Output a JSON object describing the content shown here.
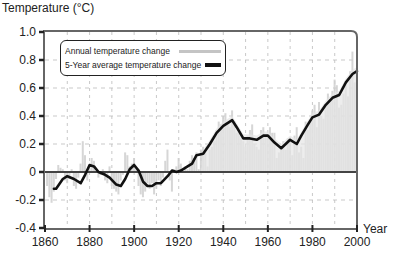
{
  "chart_data": {
    "type": "line",
    "title": "",
    "ylabel": "Temperature (°C)",
    "xlabel": "Year",
    "xlim": [
      1860,
      2000
    ],
    "ylim": [
      -0.4,
      1.0
    ],
    "x_ticks": [
      1860,
      1880,
      1900,
      1920,
      1940,
      1960,
      1980,
      2000
    ],
    "y_ticks": [
      -0.4,
      -0.2,
      0,
      0.2,
      0.4,
      0.6,
      0.8,
      1.0
    ],
    "x_tick_labels": [
      "1860",
      "1880",
      "1900",
      "1920",
      "1940",
      "1960",
      "1980",
      "2000"
    ],
    "y_tick_labels": [
      "-0.4",
      "-0.2",
      "0",
      "0.2",
      "0.4",
      "0.6",
      "0.8",
      "1.0"
    ],
    "grid": true,
    "legend_position": "upper left",
    "series": [
      {
        "name": "Annual temperature change",
        "style": "light gray bars",
        "color": "#c8c8c8",
        "x": [
          1861,
          1862,
          1863,
          1864,
          1865,
          1866,
          1867,
          1868,
          1869,
          1870,
          1871,
          1872,
          1873,
          1874,
          1875,
          1876,
          1877,
          1878,
          1879,
          1880,
          1881,
          1882,
          1883,
          1884,
          1885,
          1886,
          1887,
          1888,
          1889,
          1890,
          1891,
          1892,
          1893,
          1894,
          1895,
          1896,
          1897,
          1898,
          1899,
          1900,
          1901,
          1902,
          1903,
          1904,
          1905,
          1906,
          1907,
          1908,
          1909,
          1910,
          1911,
          1912,
          1913,
          1914,
          1915,
          1916,
          1917,
          1918,
          1919,
          1920,
          1921,
          1922,
          1923,
          1924,
          1925,
          1926,
          1927,
          1928,
          1929,
          1930,
          1931,
          1932,
          1933,
          1934,
          1935,
          1936,
          1937,
          1938,
          1939,
          1940,
          1941,
          1942,
          1943,
          1944,
          1945,
          1946,
          1947,
          1948,
          1949,
          1950,
          1951,
          1952,
          1953,
          1954,
          1955,
          1956,
          1957,
          1958,
          1959,
          1960,
          1961,
          1962,
          1963,
          1964,
          1965,
          1966,
          1967,
          1968,
          1969,
          1970,
          1971,
          1972,
          1973,
          1974,
          1975,
          1976,
          1977,
          1978,
          1979,
          1980,
          1981,
          1982,
          1983,
          1984,
          1985,
          1986,
          1987,
          1988,
          1989,
          1990,
          1991,
          1992,
          1993,
          1994,
          1995,
          1996,
          1997,
          1998,
          1999,
          2000
        ],
        "values": [
          -0.1,
          -0.18,
          -0.22,
          -0.14,
          -0.05,
          0.05,
          0.03,
          0.02,
          -0.06,
          -0.08,
          -0.05,
          0.02,
          -0.1,
          -0.12,
          -0.04,
          0.06,
          0.22,
          0.12,
          -0.06,
          0.05,
          0.1,
          0.08,
          0.0,
          -0.04,
          -0.02,
          0.02,
          -0.06,
          -0.08,
          0.04,
          -0.1,
          -0.12,
          -0.14,
          -0.16,
          -0.06,
          -0.02,
          0.14,
          0.12,
          0.04,
          0.06,
          0.1,
          0.02,
          -0.1,
          -0.16,
          -0.18,
          -0.14,
          -0.08,
          -0.12,
          -0.08,
          -0.16,
          -0.12,
          -0.06,
          -0.1,
          -0.04,
          0.08,
          0.16,
          -0.06,
          -0.14,
          0.02,
          0.04,
          0.1,
          0.06,
          0.0,
          0.04,
          0.02,
          0.08,
          0.12,
          0.1,
          0.14,
          0.02,
          0.16,
          0.18,
          0.14,
          0.04,
          0.16,
          0.18,
          0.22,
          0.3,
          0.36,
          0.34,
          0.4,
          0.42,
          0.34,
          0.32,
          0.44,
          0.36,
          0.28,
          0.3,
          0.24,
          0.22,
          0.18,
          0.26,
          0.3,
          0.34,
          0.2,
          0.18,
          0.16,
          0.3,
          0.32,
          0.26,
          0.24,
          0.32,
          0.28,
          0.28,
          0.1,
          0.14,
          0.18,
          0.22,
          0.16,
          0.24,
          0.22,
          0.12,
          0.26,
          0.32,
          0.14,
          0.18,
          0.1,
          0.36,
          0.3,
          0.36,
          0.44,
          0.48,
          0.32,
          0.5,
          0.4,
          0.38,
          0.48,
          0.56,
          0.52,
          0.58,
          0.66,
          0.62,
          0.46,
          0.48,
          0.56,
          0.62,
          0.54,
          0.72,
          0.86,
          0.64,
          0.66
        ]
      },
      {
        "name": "5-Year average temperature change",
        "style": "thick black line",
        "color": "#111111",
        "x": [
          1864,
          1865,
          1868,
          1870,
          1873,
          1876,
          1878,
          1880,
          1882,
          1884,
          1887,
          1889,
          1892,
          1894,
          1896,
          1898,
          1900,
          1902,
          1904,
          1906,
          1908,
          1910,
          1912,
          1915,
          1917,
          1919,
          1921,
          1924,
          1926,
          1928,
          1931,
          1934,
          1937,
          1940,
          1944,
          1946,
          1949,
          1952,
          1955,
          1958,
          1960,
          1963,
          1966,
          1968,
          1970,
          1973,
          1975,
          1978,
          1980,
          1983,
          1986,
          1989,
          1992,
          1995,
          1998,
          2000
        ],
        "values": [
          -0.12,
          -0.12,
          -0.05,
          -0.03,
          -0.05,
          -0.08,
          -0.02,
          0.05,
          0.04,
          0.0,
          -0.02,
          -0.04,
          -0.09,
          -0.1,
          -0.05,
          0.02,
          0.05,
          0.01,
          -0.07,
          -0.1,
          -0.1,
          -0.08,
          -0.08,
          -0.03,
          0.01,
          0.0,
          0.01,
          0.04,
          0.06,
          0.12,
          0.13,
          0.2,
          0.28,
          0.33,
          0.37,
          0.32,
          0.24,
          0.24,
          0.23,
          0.26,
          0.26,
          0.21,
          0.17,
          0.2,
          0.23,
          0.2,
          0.26,
          0.34,
          0.39,
          0.41,
          0.48,
          0.53,
          0.55,
          0.64,
          0.7,
          0.72
        ]
      }
    ]
  },
  "axes": {
    "y_title": "Temperature (°C)",
    "x_title": "Year"
  },
  "legend": {
    "items": [
      {
        "label": "Annual temperature change",
        "color": "#c4c4c4"
      },
      {
        "label": "5-Year average temperature change",
        "color": "#111111"
      }
    ]
  },
  "colors": {
    "axis": "#555555",
    "zero_line": "#444444",
    "grid": "#bbbbbb",
    "annual_bars": "#cfcfcf",
    "five_year_line": "#111111"
  }
}
